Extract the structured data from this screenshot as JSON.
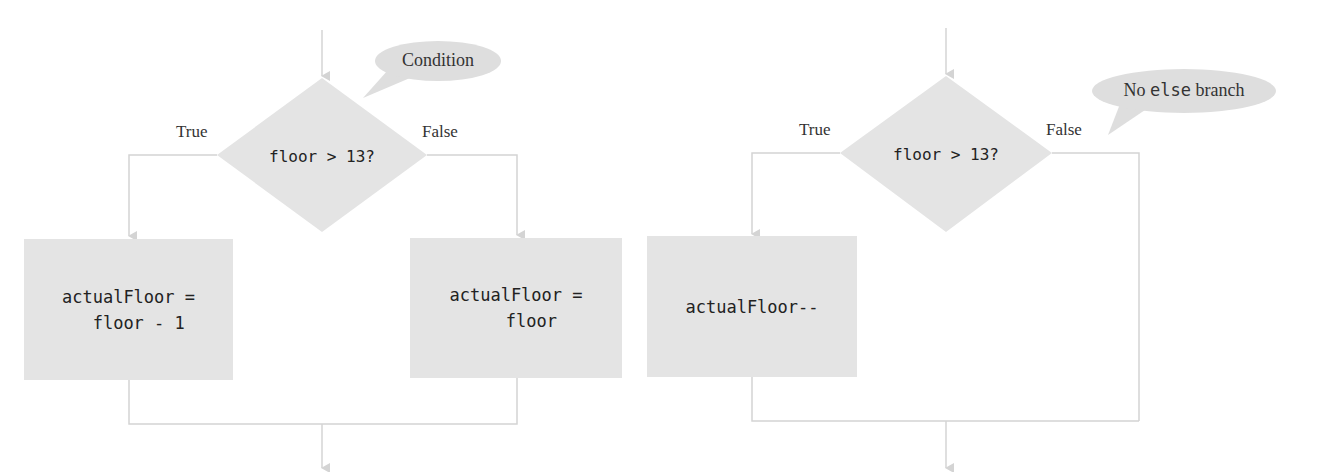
{
  "colors": {
    "shape_fill": "#e4e4e4",
    "connector": "#d4d4d4",
    "text": "#222222",
    "label_text": "#333333"
  },
  "left_flowchart": {
    "callout": "Condition",
    "decision": "floor > 13?",
    "true_label": "True",
    "false_label": "False",
    "true_box": "actualFloor =\n  floor - 1",
    "false_box": "actualFloor =\n   floor"
  },
  "right_flowchart": {
    "callout_prefix": "No ",
    "callout_keyword": "else",
    "callout_suffix": " branch",
    "decision": "floor > 13?",
    "true_label": "True",
    "false_label": "False",
    "true_box": "actualFloor--"
  }
}
